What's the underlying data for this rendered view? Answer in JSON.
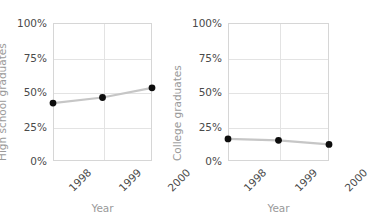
{
  "figure": {
    "title": "",
    "width": 352,
    "height": 215,
    "background": "#ffffff"
  },
  "style": {
    "line_color": "#c6c6c6",
    "marker_color": "#0d0d0d",
    "grid_color": "#e3e3e3",
    "axis_color": "#d6d6d6",
    "tick_text_color": "#4a4a4a",
    "axis_title_color": "#9a9a9a"
  },
  "chart_data": [
    {
      "type": "line",
      "title": "",
      "xlabel": "Year",
      "ylabel": "High school graduates",
      "categories": [
        "1998",
        "1999",
        "2000"
      ],
      "x": [
        1998,
        1999,
        2000
      ],
      "values": [
        42,
        46,
        53
      ],
      "ylim": [
        0,
        100
      ],
      "yticks": [
        0,
        25,
        50,
        75,
        100
      ],
      "ytick_labels": [
        "0%",
        "25%",
        "50%",
        "75%",
        "100%"
      ],
      "grid": true,
      "legend": "none",
      "marker": "circle",
      "line_color": "#c6c6c6",
      "marker_color": "#0d0d0d"
    },
    {
      "type": "line",
      "title": "",
      "xlabel": "Year",
      "ylabel": "College graduates",
      "categories": [
        "1998",
        "1999",
        "2000"
      ],
      "x": [
        1998,
        1999,
        2000
      ],
      "values": [
        16,
        15,
        12
      ],
      "ylim": [
        0,
        100
      ],
      "yticks": [
        0,
        25,
        50,
        75,
        100
      ],
      "ytick_labels": [
        "0%",
        "25%",
        "50%",
        "75%",
        "100%"
      ],
      "grid": true,
      "legend": "none",
      "marker": "circle",
      "line_color": "#c6c6c6",
      "marker_color": "#0d0d0d"
    }
  ]
}
